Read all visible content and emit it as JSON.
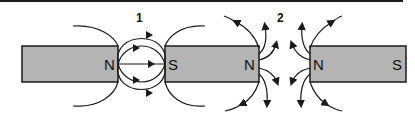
{
  "figure": {
    "panel_1": {
      "label": "1",
      "description": "Opposite poles facing: field lines connect N to S (attraction)",
      "left_magnet_pole": "N",
      "right_magnet_pole": "S"
    },
    "panel_2": {
      "label": "2",
      "description": "Like poles facing: field lines diverge (repulsion)",
      "left_magnet_pole": "N",
      "right_magnet": {
        "left_pole": "N",
        "right_pole": "S"
      }
    },
    "colors": {
      "magnet_fill": "#b4b4b4",
      "stroke": "#1a1a1a",
      "background": "#ffffff"
    }
  }
}
